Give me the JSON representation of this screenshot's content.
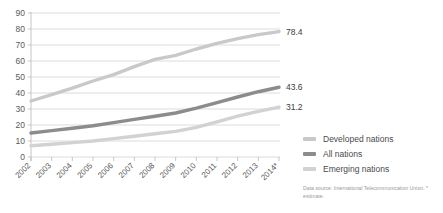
{
  "chart_data": {
    "type": "line",
    "title": "",
    "xlabel": "",
    "ylabel": "",
    "ylim": [
      0,
      90
    ],
    "ytick_step": 10,
    "grid": true,
    "legend_position": "right",
    "categories": [
      "2002",
      "2003",
      "2004",
      "2005",
      "2006",
      "2007",
      "2008",
      "2009",
      "2010",
      "2011",
      "2012",
      "2013",
      "2014*"
    ],
    "series": [
      {
        "name": "Developed nations",
        "color": "#c9c9c9",
        "values": [
          35.0,
          39.0,
          43.0,
          47.5,
          51.5,
          56.5,
          61.0,
          63.5,
          67.5,
          71.0,
          74.0,
          76.5,
          78.4
        ],
        "end_label": "78.4"
      },
      {
        "name": "All nations",
        "color": "#8c8c8c",
        "values": [
          15.0,
          16.5,
          18.0,
          19.5,
          21.5,
          23.5,
          25.5,
          27.5,
          30.5,
          34.0,
          37.5,
          40.8,
          43.6
        ],
        "end_label": "43.6"
      },
      {
        "name": "Emerging nations",
        "color": "#d2d2d2",
        "values": [
          7.0,
          8.0,
          9.0,
          10.0,
          11.5,
          13.0,
          14.5,
          16.0,
          18.5,
          22.0,
          25.5,
          28.5,
          31.2
        ],
        "end_label": "31.2"
      }
    ],
    "yticks": [
      "0",
      "10",
      "20",
      "30",
      "40",
      "50",
      "60",
      "70",
      "80",
      "90"
    ]
  },
  "legend": {
    "items": [
      {
        "label": "Developed nations",
        "color": "#c9c9c9"
      },
      {
        "label": "All nations",
        "color": "#8c8c8c"
      },
      {
        "label": "Emerging nations",
        "color": "#d2d2d2"
      }
    ]
  },
  "source_note": "Data source: International Telecommunication Union. * estimate.",
  "colors": {
    "grid": "#d8d8d8",
    "axis": "#c0c0c0",
    "tick_text": "#5a5a5a",
    "label_text": "#3c3c3c",
    "source_text": "#9a9a9a",
    "background": "#ffffff"
  }
}
